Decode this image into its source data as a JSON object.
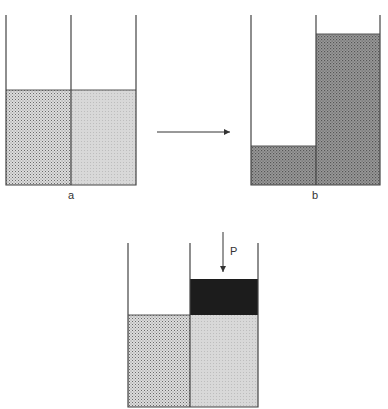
{
  "diagram": {
    "panels": [
      {
        "id": "a",
        "label": "a",
        "left_level": "equal",
        "right_level": "equal"
      },
      {
        "id": "b",
        "label": "b",
        "left_level": "low",
        "right_level": "high"
      },
      {
        "id": "c",
        "label": "",
        "piston_label": "P"
      }
    ],
    "arrow": {
      "from": "a",
      "to": "b"
    },
    "colors": {
      "outline": "#444444",
      "dotted_fill": "#c8c8c8",
      "light_fill": "#d6d6d6",
      "dark_fill": "#8a8a8a",
      "piston": "#1c1c1c"
    }
  }
}
